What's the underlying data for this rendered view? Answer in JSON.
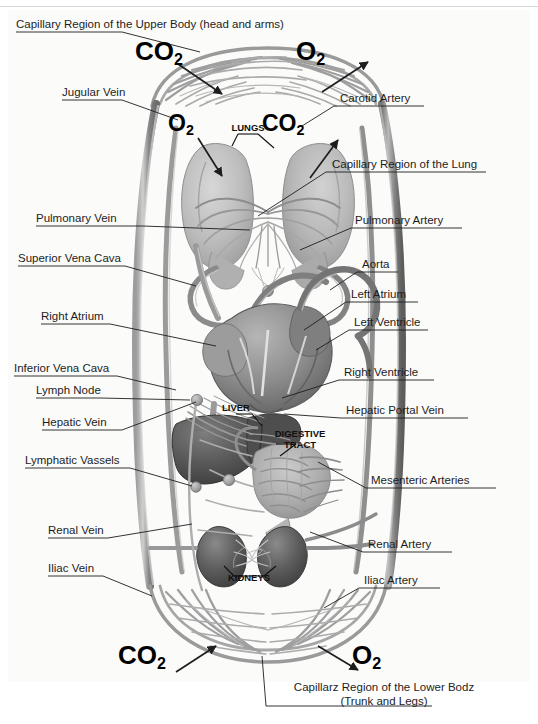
{
  "figure": {
    "width": 538,
    "height": 724,
    "background_color": "#ffffff",
    "illustration_tint": "#fbfbfa",
    "ink_color": "#1d1d1d",
    "vessel_dark": "#6b6b6b",
    "vessel_mid": "#8e8e8e",
    "vessel_light": "#b4b4b4",
    "organ_dark": "#4a4a4a",
    "organ_mid": "#9a9a9a",
    "organ_light": "#c9c9c9"
  },
  "gas_labels": [
    {
      "id": "co2-upper",
      "text": "CO",
      "sub": "2"
    },
    {
      "id": "o2-upper",
      "text": "O",
      "sub": "2"
    },
    {
      "id": "o2-lung",
      "text": "O",
      "sub": "2"
    },
    {
      "id": "co2-lung",
      "text": "CO",
      "sub": "2"
    },
    {
      "id": "co2-lower",
      "text": "CO",
      "sub": "2"
    },
    {
      "id": "o2-lower",
      "text": "O",
      "sub": "2"
    }
  ],
  "organ_labels": [
    {
      "id": "lungs",
      "text": "LUNGS"
    },
    {
      "id": "liver",
      "text": "LIVER"
    },
    {
      "id": "digestive-tract",
      "line1": "DIGESTIVE",
      "line2": "TRACT"
    },
    {
      "id": "kidneys",
      "text": "KIDNEYS"
    }
  ],
  "labels_left": [
    {
      "id": "capillary-upper-body",
      "text": "Capillary Region of the Upper Body (head and arms)"
    },
    {
      "id": "jugular-vein",
      "text": "Jugular Vein"
    },
    {
      "id": "pulmonary-vein",
      "text": "Pulmonary Vein"
    },
    {
      "id": "superior-vena-cava",
      "text": "Superior Vena Cava"
    },
    {
      "id": "right-atrium",
      "text": "Right Atrium"
    },
    {
      "id": "inferior-vena-cava",
      "text": "Inferior Vena Cava"
    },
    {
      "id": "lymph-node",
      "text": "Lymph Node"
    },
    {
      "id": "hepatic-vein",
      "text": "Hepatic Vein"
    },
    {
      "id": "lymphatic-vassels",
      "text": "Lymphatic Vassels"
    },
    {
      "id": "renal-vein",
      "text": "Renal Vein"
    },
    {
      "id": "iliac-vein",
      "text": "Iliac Vein"
    }
  ],
  "labels_right": [
    {
      "id": "carotid-artery",
      "text": "Carotid Artery"
    },
    {
      "id": "capillary-lung",
      "text": "Capillary Region of the Lung"
    },
    {
      "id": "pulmonary-artery",
      "text": "Pulmonary Artery"
    },
    {
      "id": "aorta",
      "text": "Aorta"
    },
    {
      "id": "left-atrium",
      "text": "Left Atrium"
    },
    {
      "id": "left-ventricle",
      "text": "Left Ventricle"
    },
    {
      "id": "right-ventricle",
      "text": "Right Ventricle"
    },
    {
      "id": "hepatic-portal-vein",
      "text": "Hepatic Portal Vein"
    },
    {
      "id": "mesenteric-arteries",
      "text": "Mesenteric Arteries"
    },
    {
      "id": "renal-artery",
      "text": "Renal Artery"
    },
    {
      "id": "iliac-artery",
      "text": "Iliac Artery"
    }
  ],
  "caption": {
    "line1": "Capillarz Region of the Lower Bodz",
    "line2": "(Trunk and Legs)"
  }
}
